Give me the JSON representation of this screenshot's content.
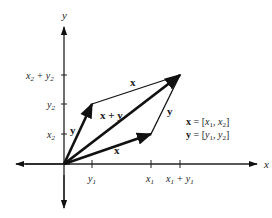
{
  "diagram": {
    "axes": {
      "x_label": "x",
      "y_label": "y"
    },
    "ticks": {
      "y_axis": [
        {
          "label_main": "x",
          "label_sub": "2",
          "label_extra": " + y",
          "label_extra_sub": "2",
          "id": "x2_plus_y2"
        },
        {
          "label_main": "y",
          "label_sub": "2",
          "id": "y2"
        },
        {
          "label_main": "x",
          "label_sub": "2",
          "id": "x2"
        }
      ],
      "x_axis": [
        {
          "label_main": "y",
          "label_sub": "1",
          "id": "y1"
        },
        {
          "label_main": "x",
          "label_sub": "1",
          "id": "x1"
        },
        {
          "label_main": "x",
          "label_sub": "1",
          "label_extra": " + y",
          "label_extra_sub": "1",
          "id": "x1_plus_y1"
        }
      ]
    },
    "vectors": {
      "x": "x",
      "y": "y",
      "sum": "x + y",
      "translated_x": "x",
      "translated_y": "y"
    },
    "definitions": {
      "x_def": {
        "name": "x",
        "eq": " = [",
        "a": "x",
        "a_sub": "1",
        "sep": ", ",
        "b": "x",
        "b_sub": "2",
        "close": "]"
      },
      "y_def": {
        "name": "y",
        "eq": " = [",
        "a": "y",
        "a_sub": "1",
        "sep": ", ",
        "b": "y",
        "b_sub": "2",
        "close": "]"
      }
    }
  }
}
